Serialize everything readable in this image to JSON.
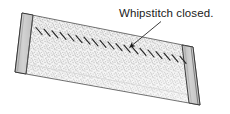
{
  "figure": {
    "kind": "line-art-illustration",
    "background_color": "#ffffff"
  },
  "annotations": [
    {
      "id": "whipstitch-label",
      "text": "Whipstitch closed.",
      "color": "#1a1a1a",
      "leader": {
        "from_x": 160,
        "from_y": 22,
        "to_x": 126,
        "to_y": 50,
        "arrowhead": "filled-triangle",
        "color": "#1a1a1a"
      }
    }
  ],
  "object": {
    "name": "fabric-panel",
    "shape": "parallelogram",
    "fill_color": "#f2f2f2",
    "texture": "stipple",
    "texture_dot_color": "#a8a8a8",
    "outline_color": "#2b2b2b",
    "corners": {
      "top_left_x": 22,
      "top_left_y": 13,
      "top_right_x": 193,
      "top_right_y": 47,
      "bottom_right_x": 200,
      "bottom_right_y": 105,
      "bottom_left_x": 15,
      "bottom_left_y": 72
    },
    "end_caps": [
      {
        "name": "left-end-cap",
        "fill_color": "#c9c9c9",
        "outline_color": "#2b2b2b",
        "width_px": 12
      },
      {
        "name": "right-end-cap",
        "fill_color": "#c9c9c9",
        "outline_color": "#2b2b2b",
        "width_px": 12
      }
    ],
    "seam": {
      "name": "whipstitch-seam",
      "stitch_count": 19,
      "stitch_color": "#262626",
      "stitch_angle_deg": 62,
      "stitch_length_px": 9,
      "start_x": 37,
      "start_y": 31,
      "end_x": 186,
      "end_y": 61
    }
  }
}
